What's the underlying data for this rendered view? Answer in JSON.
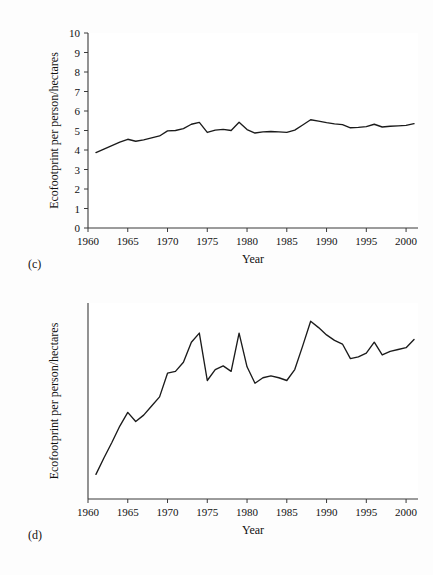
{
  "figure": {
    "background_color": "#fdfdfd",
    "line_color": "#1b1b1b",
    "axis_color": "#3a3a3a"
  },
  "panels": [
    {
      "tag": "(c)",
      "tag_name": "panel-label-c",
      "show_y_ticks": true,
      "chart_data": {
        "type": "line",
        "title": "",
        "xlabel": "Year",
        "ylabel": "Ecofootprint per person/hectares",
        "xlim": [
          1960,
          2001.5
        ],
        "ylim": [
          0,
          10
        ],
        "xticks": [
          1960,
          1965,
          1970,
          1975,
          1980,
          1985,
          1990,
          1995,
          2000
        ],
        "yticks": [
          0,
          1,
          2,
          3,
          4,
          5,
          6,
          7,
          8,
          9,
          10
        ],
        "grid": false,
        "legend": "none",
        "x": [
          1961,
          1962,
          1963,
          1964,
          1965,
          1966,
          1967,
          1968,
          1969,
          1970,
          1971,
          1972,
          1973,
          1974,
          1975,
          1976,
          1977,
          1978,
          1979,
          1980,
          1981,
          1982,
          1983,
          1984,
          1985,
          1986,
          1987,
          1988,
          1989,
          1990,
          1991,
          1992,
          1993,
          1994,
          1995,
          1996,
          1997,
          1998,
          1999,
          2000,
          2001
        ],
        "values": [
          3.87,
          4.05,
          4.22,
          4.4,
          4.55,
          4.45,
          4.52,
          4.62,
          4.72,
          4.98,
          5.0,
          5.1,
          5.32,
          5.42,
          4.9,
          5.02,
          5.06,
          5.0,
          5.42,
          5.05,
          4.87,
          4.93,
          4.95,
          4.93,
          4.9,
          5.02,
          5.28,
          5.55,
          5.48,
          5.4,
          5.34,
          5.3,
          5.14,
          5.16,
          5.2,
          5.32,
          5.18,
          5.22,
          5.24,
          5.26,
          5.35
        ]
      }
    },
    {
      "tag": "(d)",
      "tag_name": "panel-label-d",
      "show_y_ticks": false,
      "chart_data": {
        "type": "line",
        "title": "",
        "xlabel": "Year",
        "ylabel": "Ecofootprint per person/hectares",
        "xlim": [
          1960,
          2001.5
        ],
        "ylim": [
          3.6,
          5.75
        ],
        "xticks": [
          1960,
          1965,
          1970,
          1975,
          1980,
          1985,
          1990,
          1995,
          2000
        ],
        "yticks": [],
        "grid": false,
        "legend": "none",
        "x": [
          1961,
          1962,
          1963,
          1964,
          1965,
          1966,
          1967,
          1968,
          1969,
          1970,
          1971,
          1972,
          1973,
          1974,
          1975,
          1976,
          1977,
          1978,
          1979,
          1980,
          1981,
          1982,
          1983,
          1984,
          1985,
          1986,
          1987,
          1988,
          1989,
          1990,
          1991,
          1992,
          1993,
          1994,
          1995,
          1996,
          1997,
          1998,
          1999,
          2000,
          2001
        ],
        "values": [
          3.87,
          4.05,
          4.22,
          4.4,
          4.55,
          4.45,
          4.52,
          4.62,
          4.72,
          4.98,
          5.0,
          5.1,
          5.32,
          5.42,
          4.9,
          5.02,
          5.06,
          5.0,
          5.42,
          5.05,
          4.87,
          4.93,
          4.95,
          4.93,
          4.9,
          5.02,
          5.28,
          5.55,
          5.48,
          5.4,
          5.34,
          5.3,
          5.14,
          5.16,
          5.2,
          5.32,
          5.18,
          5.22,
          5.24,
          5.26,
          5.35
        ]
      }
    }
  ]
}
